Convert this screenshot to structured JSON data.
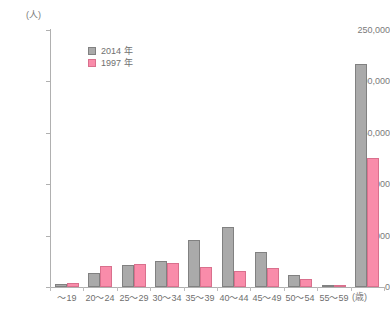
{
  "chart_data": {
    "type": "bar",
    "title": "",
    "subtitle": "",
    "xlabel": "(歳)",
    "ylabel": "(人)",
    "ylim": [
      0,
      250000
    ],
    "ytick_values": [
      0,
      50000,
      100000,
      150000,
      200000,
      250000
    ],
    "ytick_labels": [
      "0",
      "50,000",
      "100,000",
      "150,000",
      "200,000",
      "250,000"
    ],
    "grid": false,
    "legend_position": "top-left-inside",
    "categories": [
      "～19",
      "20～24",
      "25～29",
      "30～34",
      "35～39",
      "40～44",
      "45～49",
      "50～54",
      "55～59",
      ""
    ],
    "series": [
      {
        "name": "2014 年",
        "color": "#aaaaaa",
        "values": [
          2500,
          13500,
          21500,
          25500,
          45500,
          58500,
          34500,
          11500,
          2000,
          217000
        ]
      },
      {
        "name": "1997 年",
        "color": "#f98caa",
        "values": [
          4000,
          20000,
          22500,
          23000,
          19500,
          15500,
          18500,
          7500,
          1000,
          125500
        ]
      }
    ]
  },
  "legend": {
    "items": [
      {
        "label": "2014 年",
        "swatch": "gray"
      },
      {
        "label": "1997 年",
        "swatch": "pink"
      }
    ]
  },
  "axes": {
    "y_unit": "(人)",
    "x_unit": "(歳)"
  }
}
